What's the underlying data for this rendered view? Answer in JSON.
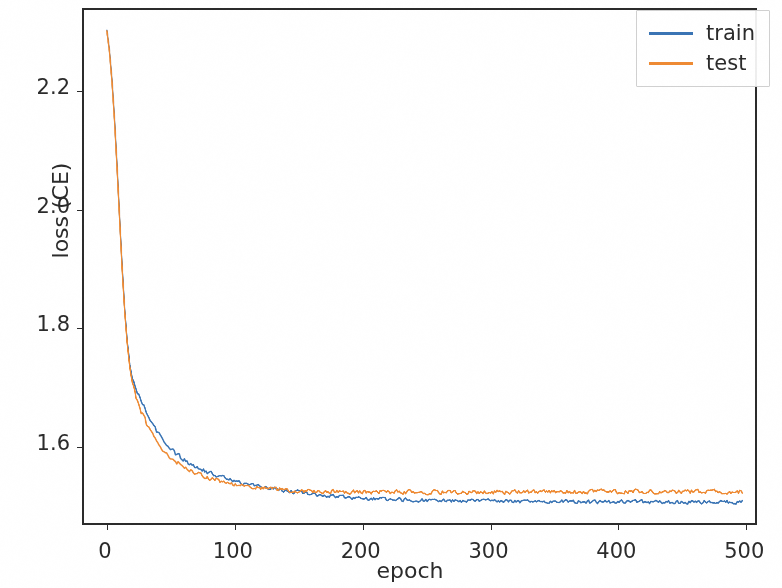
{
  "chart_data": {
    "type": "line",
    "title": "",
    "xlabel": "epoch",
    "ylabel": "loss (CE)",
    "xlim": [
      -18,
      510
    ],
    "ylim": [
      1.4655,
      2.3365
    ],
    "xticks": [
      0,
      100,
      200,
      300,
      400,
      500
    ],
    "xtick_labels": [
      "0",
      "100",
      "200",
      "300",
      "400",
      "500"
    ],
    "yticks": [
      1.6,
      1.8,
      2.0,
      2.2
    ],
    "ytick_labels": [
      "1.6",
      "1.8",
      "2.0",
      "2.2"
    ],
    "grid": false,
    "legend_position": "upper right",
    "legend_frame": true,
    "series": [
      {
        "name": "train",
        "color": "#3a74b4",
        "linewidth": 1.5,
        "x": [
          0,
          2,
          4,
          6,
          8,
          10,
          12,
          14,
          16,
          18,
          20,
          24,
          28,
          32,
          36,
          40,
          45,
          50,
          55,
          60,
          65,
          70,
          75,
          80,
          85,
          90,
          95,
          100,
          110,
          120,
          130,
          140,
          150,
          160,
          170,
          180,
          190,
          200,
          220,
          240,
          260,
          280,
          300,
          320,
          340,
          360,
          380,
          400,
          420,
          440,
          460,
          480,
          500
        ],
        "values": [
          2.302,
          2.268,
          2.218,
          2.152,
          2.072,
          1.985,
          1.901,
          1.829,
          1.774,
          1.736,
          1.712,
          1.686,
          1.668,
          1.65,
          1.634,
          1.62,
          1.605,
          1.592,
          1.582,
          1.574,
          1.567,
          1.561,
          1.556,
          1.551,
          1.547,
          1.543,
          1.54,
          1.537,
          1.532,
          1.528,
          1.524,
          1.521,
          1.518,
          1.515,
          1.513,
          1.511,
          1.509,
          1.508,
          1.506,
          1.505,
          1.504,
          1.503,
          1.503,
          1.502,
          1.502,
          1.502,
          1.501,
          1.501,
          1.501,
          1.501,
          1.501,
          1.501,
          1.501
        ]
      },
      {
        "name": "test",
        "color": "#ee8a33",
        "linewidth": 1.5,
        "x": [
          0,
          2,
          4,
          6,
          8,
          10,
          12,
          14,
          16,
          18,
          20,
          24,
          28,
          32,
          36,
          40,
          45,
          50,
          55,
          60,
          65,
          70,
          75,
          80,
          85,
          90,
          95,
          100,
          110,
          120,
          130,
          140,
          150,
          160,
          170,
          180,
          190,
          200,
          220,
          240,
          260,
          280,
          300,
          320,
          340,
          360,
          380,
          400,
          420,
          440,
          460,
          480,
          500
        ],
        "values": [
          2.301,
          2.266,
          2.215,
          2.148,
          2.068,
          1.981,
          1.897,
          1.825,
          1.769,
          1.729,
          1.703,
          1.672,
          1.651,
          1.632,
          1.616,
          1.602,
          1.588,
          1.577,
          1.568,
          1.561,
          1.555,
          1.55,
          1.546,
          1.542,
          1.539,
          1.536,
          1.534,
          1.532,
          1.529,
          1.526,
          1.524,
          1.522,
          1.521,
          1.52,
          1.519,
          1.519,
          1.518,
          1.518,
          1.518,
          1.518,
          1.518,
          1.518,
          1.518,
          1.518,
          1.518,
          1.518,
          1.519,
          1.519,
          1.519,
          1.519,
          1.519,
          1.519,
          1.519
        ]
      }
    ],
    "noise_amplitude": {
      "train": 0.0045,
      "test": 0.005
    },
    "annotations": []
  },
  "legend": {
    "entries": [
      {
        "label": "train",
        "color": "#3a74b4"
      },
      {
        "label": "test",
        "color": "#ee8a33"
      }
    ]
  },
  "axis_color": "#2b2b2b",
  "background": "#ffffff"
}
